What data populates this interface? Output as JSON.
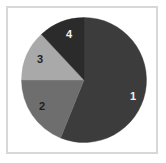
{
  "figure": {
    "width": 166,
    "height": 163,
    "background_color": "#ffffff",
    "frame_color": "#d8d8d8"
  },
  "chart_data": {
    "type": "pie",
    "title": "",
    "subtitle": "",
    "xlabel": "",
    "ylabel": "",
    "grid": false,
    "legend": "none",
    "labels_position": "inside-slices",
    "start_angle_deg": 0,
    "direction": "clockwise",
    "center_px": [
      84,
      80
    ],
    "radius_px": 63,
    "categories": [
      "1",
      "2",
      "3",
      "4"
    ],
    "values": [
      56,
      19,
      13,
      12
    ],
    "value_unit": "%",
    "colors": [
      "#3c3c3c",
      "#6e6e6e",
      "#a9a9a9",
      "#2b2b2b"
    ],
    "label_colors": [
      "#f2f2f2",
      "#1e1e1e",
      "#1e1e1e",
      "#f2f2f2"
    ],
    "slices": [
      {
        "label": "1",
        "value": 56,
        "color": "#3c3c3c",
        "label_color": "#f2f2f2",
        "start_deg": 0,
        "end_deg": 202,
        "label_x_px": 133,
        "label_y_px": 96
      },
      {
        "label": "2",
        "value": 19,
        "color": "#6e6e6e",
        "label_color": "#1e1e1e",
        "start_deg": 202,
        "end_deg": 270,
        "label_x_px": 42,
        "label_y_px": 106
      },
      {
        "label": "3",
        "value": 13,
        "color": "#a9a9a9",
        "label_color": "#1e1e1e",
        "start_deg": 270,
        "end_deg": 317,
        "label_x_px": 40,
        "label_y_px": 59
      },
      {
        "label": "4",
        "value": 12,
        "color": "#2b2b2b",
        "label_color": "#f2f2f2",
        "start_deg": 317,
        "end_deg": 360,
        "label_x_px": 69,
        "label_y_px": 34
      }
    ]
  }
}
